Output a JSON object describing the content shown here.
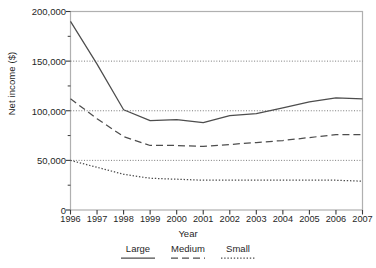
{
  "chart_data": {
    "type": "line",
    "title": "",
    "xlabel": "Year",
    "ylabel": "Net income ($)",
    "x": [
      1996,
      1997,
      1998,
      1999,
      2000,
      2001,
      2002,
      2003,
      2004,
      2005,
      2006,
      2007
    ],
    "xtick_labels": [
      "1996",
      "1997",
      "1998",
      "1999",
      "2000",
      "2001",
      "2002",
      "2003",
      "2004",
      "2005",
      "2006",
      "2007"
    ],
    "ytick_labels": [
      "0",
      "50,000",
      "100,000",
      "150,000",
      "200,000"
    ],
    "ytick_values": [
      0,
      50000,
      100000,
      150000,
      200000
    ],
    "ylim": [
      0,
      200000
    ],
    "xlim": [
      1996,
      2007
    ],
    "grid": "horizontal-dotted",
    "legend_position": "below-axis",
    "series": [
      {
        "name": "Large",
        "style": "solid",
        "color": "#4d4d4d",
        "values": [
          190000,
          147000,
          101000,
          90000,
          91000,
          88000,
          95000,
          97000,
          103000,
          109000,
          113000,
          112000
        ]
      },
      {
        "name": "Medium",
        "style": "dashed",
        "color": "#4d4d4d",
        "values": [
          112000,
          92000,
          74000,
          65000,
          65000,
          64000,
          66000,
          68000,
          70000,
          73000,
          76000,
          76000
        ]
      },
      {
        "name": "Small",
        "style": "dotted",
        "color": "#4d4d4d",
        "values": [
          50000,
          43000,
          36000,
          32000,
          31000,
          30000,
          30000,
          30000,
          30000,
          30000,
          30000,
          29000
        ]
      }
    ]
  },
  "axes": {
    "ylabel": "Net income ($)",
    "xlabel": "Year",
    "ytick_0": "0",
    "ytick_1": "50,000",
    "ytick_2": "100,000",
    "ytick_3": "150,000",
    "ytick_4": "200,000"
  },
  "legend": {
    "items": [
      {
        "label": "Large",
        "style": "solid"
      },
      {
        "label": "Medium",
        "style": "dashed"
      },
      {
        "label": "Small",
        "style": "dotted"
      }
    ]
  },
  "colors": {
    "line": "#4d4d4d",
    "frame": "#b0b0b0",
    "grid": "#6b6b6b",
    "text": "#1f1f1f",
    "background": "#ffffff"
  }
}
